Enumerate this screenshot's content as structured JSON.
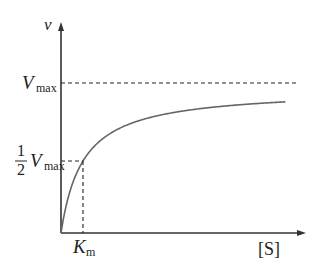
{
  "chart_data": {
    "type": "line",
    "title": "",
    "xlabel": "[S]",
    "ylabel": "v",
    "series": [
      {
        "name": "Michaelis-Menten curve",
        "equation": "v = Vmax*[S]/(Km+[S])",
        "Vmax": 1,
        "Km": 1
      }
    ],
    "xlim": [
      0,
      10
    ],
    "ylim": [
      0,
      1.2
    ],
    "annotations": [
      {
        "type": "hline",
        "label_main": "V",
        "label_sub": "max",
        "y": 1
      },
      {
        "type": "point",
        "label_frac_num": "1",
        "label_frac_den": "2",
        "label_main": "V",
        "label_sub": "max",
        "x": 1,
        "y": 0.5
      },
      {
        "type": "xmark",
        "label_main": "K",
        "label_sub": "m",
        "x": 1
      }
    ],
    "grid": false,
    "legend": "none"
  }
}
